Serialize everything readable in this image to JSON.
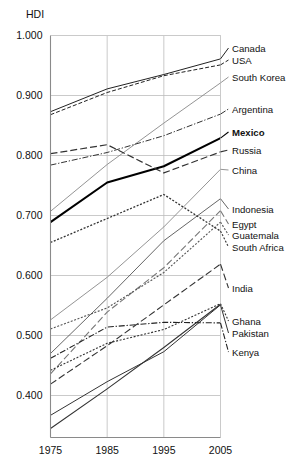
{
  "chart_data": {
    "type": "line",
    "title": "",
    "ylabel": "HDI",
    "xlabel": "",
    "x": [
      1975,
      1985,
      1995,
      2005
    ],
    "xticklabels": [
      "1975",
      "1985",
      "1995",
      "2005"
    ],
    "yticks": [
      0.4,
      0.5,
      0.6,
      0.7,
      0.8,
      0.9,
      1.0
    ],
    "yticklabels": [
      "0.400",
      "0.500",
      "0.600",
      "0.700",
      "0.800",
      "0.900",
      "1.000"
    ],
    "ylim": [
      0.33,
      1.0
    ],
    "xlim": [
      1975,
      2005
    ],
    "grid": true,
    "legend_position": "right-inline",
    "series": [
      {
        "name": "Canada",
        "values": [
          0.873,
          0.911,
          0.935,
          0.961
        ],
        "style": "solid",
        "width": 1.0,
        "color": "#222222",
        "label_y": 44
      },
      {
        "name": "USA",
        "values": [
          0.868,
          0.905,
          0.933,
          0.951
        ],
        "style": "dashed",
        "width": 1.0,
        "color": "#222222",
        "label_y": 56
      },
      {
        "name": "South Korea",
        "values": [
          0.707,
          0.785,
          0.854,
          0.921
        ],
        "style": "solid",
        "width": 0.9,
        "color": "#888888",
        "label_y": 73
      },
      {
        "name": "Argentina",
        "values": [
          0.784,
          0.805,
          0.833,
          0.869
        ],
        "style": "dashdot",
        "width": 1.0,
        "color": "#333333",
        "label_y": 105
      },
      {
        "name": "Mexico",
        "values": [
          0.689,
          0.755,
          0.782,
          0.829
        ],
        "style": "solid",
        "width": 2.1,
        "color": "#000000",
        "label_y": 128,
        "bold": true
      },
      {
        "name": "Russia",
        "values": [
          0.803,
          0.818,
          0.771,
          0.806
        ],
        "style": "longdash",
        "width": 1.2,
        "color": "#333333",
        "label_y": 146
      },
      {
        "name": "China",
        "values": [
          0.526,
          0.597,
          0.681,
          0.777
        ],
        "style": "solid",
        "width": 0.9,
        "color": "#888888",
        "label_y": 166
      },
      {
        "name": "Indonesia",
        "values": [
          0.47,
          0.562,
          0.658,
          0.728
        ],
        "style": "solid",
        "width": 0.9,
        "color": "#555555",
        "label_y": 205
      },
      {
        "name": "Egypt",
        "values": [
          0.436,
          0.539,
          0.613,
          0.708
        ],
        "style": "longdash",
        "width": 1.1,
        "color": "#777777",
        "label_y": 220
      },
      {
        "name": "Guatemala",
        "values": [
          0.511,
          0.546,
          0.605,
          0.689
        ],
        "style": "dotted",
        "width": 1.1,
        "color": "#555555",
        "label_y": 231
      },
      {
        "name": "South Africa",
        "values": [
          0.655,
          0.695,
          0.735,
          0.674
        ],
        "style": "dotted",
        "width": 1.3,
        "color": "#333333",
        "label_y": 243
      },
      {
        "name": "India",
        "values": [
          0.419,
          0.483,
          0.551,
          0.619
        ],
        "style": "longdash",
        "width": 1.1,
        "color": "#333333",
        "label_y": 284
      },
      {
        "name": "Ghana",
        "values": [
          0.442,
          0.487,
          0.51,
          0.553
        ],
        "style": "dotted",
        "width": 1.1,
        "color": "#333333",
        "label_y": 317
      },
      {
        "name": "Pakistan",
        "values": [
          0.367,
          0.423,
          0.473,
          0.551
        ],
        "style": "solid",
        "width": 1.0,
        "color": "#333333",
        "label_y": 329
      },
      {
        "name": "Kenya",
        "values": [
          0.462,
          0.514,
          0.522,
          0.521
        ],
        "style": "dashdot",
        "width": 1.1,
        "color": "#222222",
        "label_y": 348
      },
      {
        "name": "",
        "values": [
          0.345,
          0.411,
          0.48,
          0.552
        ],
        "style": "solid",
        "width": 1.1,
        "color": "#333333",
        "label_y": -1
      }
    ]
  },
  "axis": {
    "y_title": "HDI"
  }
}
